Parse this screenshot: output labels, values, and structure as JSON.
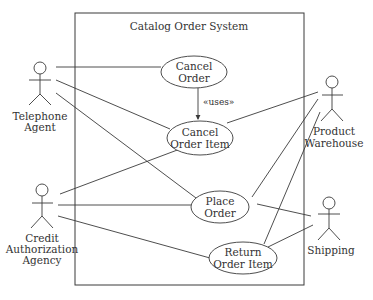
{
  "system": {
    "title": "Catalog Order System",
    "box": {
      "x": 75,
      "y": 13,
      "w": 229,
      "h": 272
    }
  },
  "actors": [
    {
      "id": "telephone-agent",
      "lines": [
        "Telephone",
        "Agent"
      ],
      "head": [
        40,
        68
      ]
    },
    {
      "id": "credit-authorization-agency",
      "lines": [
        "Credit",
        "Authorization",
        "Agency"
      ],
      "head": [
        42,
        190
      ]
    },
    {
      "id": "product-warehouse",
      "lines": [
        "Product",
        "Warehouse"
      ],
      "head": [
        330,
        87
      ]
    },
    {
      "id": "shipping",
      "lines": [
        "Shipping"
      ],
      "head": [
        330,
        203
      ]
    }
  ],
  "use_cases": [
    {
      "id": "cancel-order",
      "lines": [
        "Cancel",
        "Order"
      ],
      "cx": 194,
      "cy": 72,
      "rx": 33,
      "ry": 16
    },
    {
      "id": "cancel-order-item",
      "lines": [
        "Cancel",
        "Order Item"
      ],
      "cx": 219,
      "cy": 138,
      "rx": 33,
      "ry": 17
    },
    {
      "id": "place-order",
      "lines": [
        "Place",
        "Order"
      ],
      "cx": 220,
      "cy": 208,
      "rx": 29,
      "ry": 16
    },
    {
      "id": "return-order-item",
      "lines": [
        "Return",
        "Order Item"
      ],
      "cx": 243,
      "cy": 258,
      "rx": 34,
      "ry": 16
    }
  ],
  "relationships": [
    {
      "from": "telephone-agent",
      "to": "cancel-order",
      "type": "association"
    },
    {
      "from": "telephone-agent",
      "to": "cancel-order-item",
      "type": "association"
    },
    {
      "from": "telephone-agent",
      "to": "place-order",
      "type": "association"
    },
    {
      "from": "credit-authorization-agency",
      "to": "cancel-order-item",
      "type": "association"
    },
    {
      "from": "credit-authorization-agency",
      "to": "place-order",
      "type": "association"
    },
    {
      "from": "credit-authorization-agency",
      "to": "return-order-item",
      "type": "association"
    },
    {
      "from": "product-warehouse",
      "to": "cancel-order-item",
      "type": "association"
    },
    {
      "from": "product-warehouse",
      "to": "place-order",
      "type": "association"
    },
    {
      "from": "product-warehouse",
      "to": "return-order-item",
      "type": "association"
    },
    {
      "from": "shipping",
      "to": "place-order",
      "type": "association"
    },
    {
      "from": "shipping",
      "to": "return-order-item",
      "type": "association"
    },
    {
      "from": "cancel-order",
      "to": "cancel-order-item",
      "type": "uses",
      "label": "«uses»"
    }
  ],
  "labels": {
    "system_title": "Catalog Order System",
    "uses": "«uses»",
    "uc_cancel_order_1": "Cancel",
    "uc_cancel_order_2": "Order",
    "uc_cancel_item_1": "Cancel",
    "uc_cancel_item_2": "Order Item",
    "uc_place_order_1": "Place",
    "uc_place_order_2": "Order",
    "uc_return_item_1": "Return",
    "uc_return_item_2": "Order Item",
    "actor_telephone_1": "Telephone",
    "actor_telephone_2": "Agent",
    "actor_credit_1": "Credit",
    "actor_credit_2": "Authorization",
    "actor_credit_3": "Agency",
    "actor_warehouse_1": "Product",
    "actor_warehouse_2": "Warehouse",
    "actor_shipping_1": "Shipping"
  },
  "colors": {
    "stroke": "#3a3a3a",
    "text": "#333333",
    "background": "#ffffff"
  }
}
